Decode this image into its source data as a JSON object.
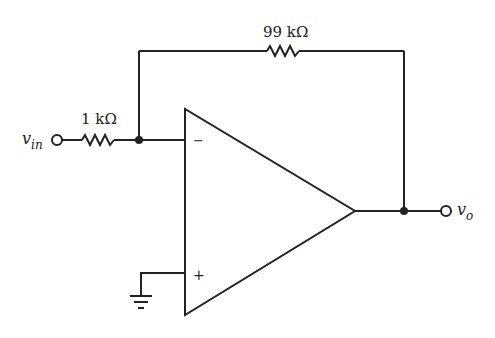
{
  "diagram": {
    "type": "inverting-amplifier",
    "components": {
      "input_resistor": {
        "label": "1 kΩ"
      },
      "feedback_resistor": {
        "label": "99 kΩ"
      },
      "opamp": {
        "inverting_sign": "−",
        "noninverting_sign": "+"
      }
    },
    "terminals": {
      "input": {
        "label_main": "v",
        "label_sub": "in"
      },
      "output": {
        "label_main": "v",
        "label_sub": "o"
      }
    },
    "colors": {
      "stroke": "#222222",
      "background": "#ffffff"
    }
  }
}
